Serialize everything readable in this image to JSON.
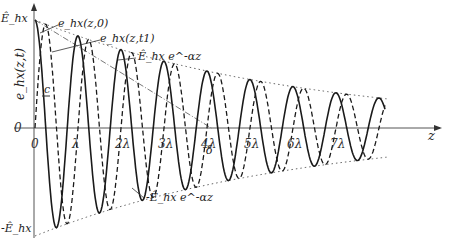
{
  "chart_data": {
    "type": "line",
    "title": "",
    "xlabel": "z",
    "ylabel": "e_hx(z,t)",
    "x_unit": "λ",
    "xlim": [
      0,
      8.2
    ],
    "ylim": [
      -1,
      1
    ],
    "amplitude_label_top": "Ê_hx",
    "amplitude_label_bottom": "-Ê_hx",
    "y_zero_label": "0",
    "x_tick_labels": [
      "0",
      "λ",
      "2λ",
      "3λ",
      "4λ",
      "5λ",
      "6λ",
      "7λ"
    ],
    "x_ticks": [
      0,
      1,
      2,
      3,
      4,
      5,
      6,
      7
    ],
    "attenuation_per_lambda": 0.16,
    "series": [
      {
        "name": "e_hx(z,0)",
        "style": "solid",
        "phase_shift_lambda": 0
      },
      {
        "name": "e_hx(z,t1)",
        "style": "dashed",
        "phase_shift_lambda": 0.25
      },
      {
        "name": "Ê_hx e^{-αz}",
        "style": "dotted",
        "envelope": "upper"
      },
      {
        "name": "-Ê_hx e^{-αz}",
        "style": "dotted",
        "envelope": "lower"
      }
    ],
    "annotations": [
      {
        "text": "e_hx(z,0)",
        "points_to": "solid curve"
      },
      {
        "text": "e_hx(z,t1)",
        "points_to": "dashed curve"
      },
      {
        "text": "Ê_hx e^-αz",
        "points_to": "upper envelope"
      },
      {
        "text": "-Ê_hx e^-αz",
        "points_to": "lower envelope"
      },
      {
        "text": "c",
        "meaning": "propagation velocity arrow"
      },
      {
        "text": "δ",
        "meaning": "skin depth marker"
      }
    ],
    "grid": false,
    "legend": "none"
  }
}
